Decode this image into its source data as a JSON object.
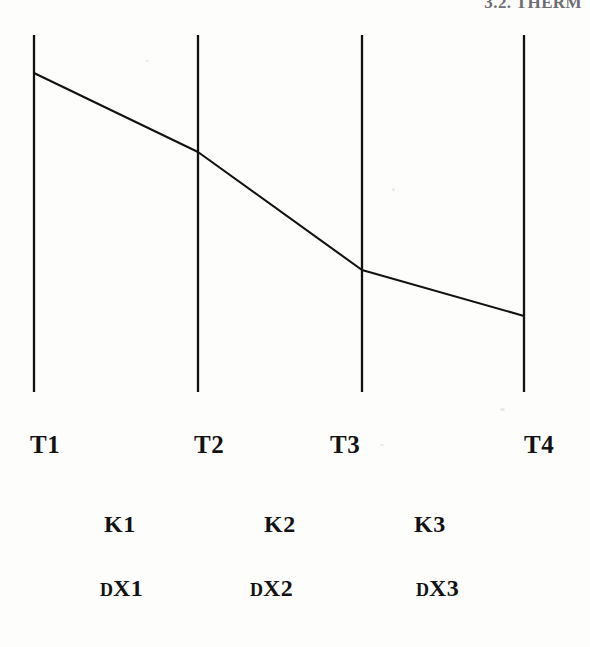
{
  "page": {
    "width": 590,
    "height": 647,
    "background_color": "#fdfdfc",
    "ink_color": "#121212",
    "header_color": "#6e6e72"
  },
  "header": {
    "text": "3.2.  THERM",
    "note_clipped": "cropped at top page edge"
  },
  "figure": {
    "name": "composite-wall-temperature-profile",
    "boundaries": [
      {
        "id": "T1",
        "x": 34,
        "y_top": 35,
        "y_bottom": 392
      },
      {
        "id": "T2",
        "x": 198,
        "y_top": 35,
        "y_bottom": 392
      },
      {
        "id": "T3",
        "x": 362,
        "y_top": 35,
        "y_bottom": 392
      },
      {
        "id": "T4",
        "x": 524,
        "y_top": 35,
        "y_bottom": 392
      }
    ],
    "temperature_profile": {
      "points": [
        {
          "x": 34,
          "y": 73
        },
        {
          "x": 198,
          "y": 152
        },
        {
          "x": 362,
          "y": 270
        },
        {
          "x": 524,
          "y": 316
        }
      ],
      "stroke_width": 2.1
    }
  },
  "labels": {
    "temperatures": [
      {
        "text": "T1",
        "x": 30,
        "y": 0
      },
      {
        "text": "T2",
        "x": 194,
        "y": 0
      },
      {
        "text": "T3",
        "x": 330,
        "y": 0
      },
      {
        "text": "T4",
        "x": 524,
        "y": 0
      }
    ],
    "conductivities": [
      {
        "text": "K1",
        "x": 104,
        "y": 0
      },
      {
        "text": "K2",
        "x": 264,
        "y": 0
      },
      {
        "text": "K3",
        "x": 414,
        "y": 0
      }
    ],
    "thicknesses": [
      {
        "prefix": "D",
        "suffix": "X1",
        "x": 100,
        "y": 0
      },
      {
        "prefix": "D",
        "suffix": "X2",
        "x": 250,
        "y": 0
      },
      {
        "prefix": "D",
        "suffix": "X3",
        "x": 416,
        "y": 0
      }
    ]
  },
  "chart_data": {
    "type": "line",
    "xlabel": "",
    "ylabel": "",
    "x": [
      0,
      1,
      2,
      3
    ],
    "series": [
      {
        "name": "Temperature profile",
        "node_labels": [
          "T1",
          "T2",
          "T3",
          "T4"
        ],
        "values_pixel_y": [
          73,
          152,
          270,
          316
        ],
        "description": "Monotonically decreasing piecewise-linear temperature; steepest drop across layer K2."
      }
    ],
    "layers": [
      {
        "conductivity": "K1",
        "thickness": "DX1",
        "from": "T1",
        "to": "T2"
      },
      {
        "conductivity": "K2",
        "thickness": "DX2",
        "from": "T2",
        "to": "T3"
      },
      {
        "conductivity": "K3",
        "thickness": "DX3",
        "from": "T3",
        "to": "T4"
      }
    ],
    "grid": false,
    "legend": "none"
  }
}
